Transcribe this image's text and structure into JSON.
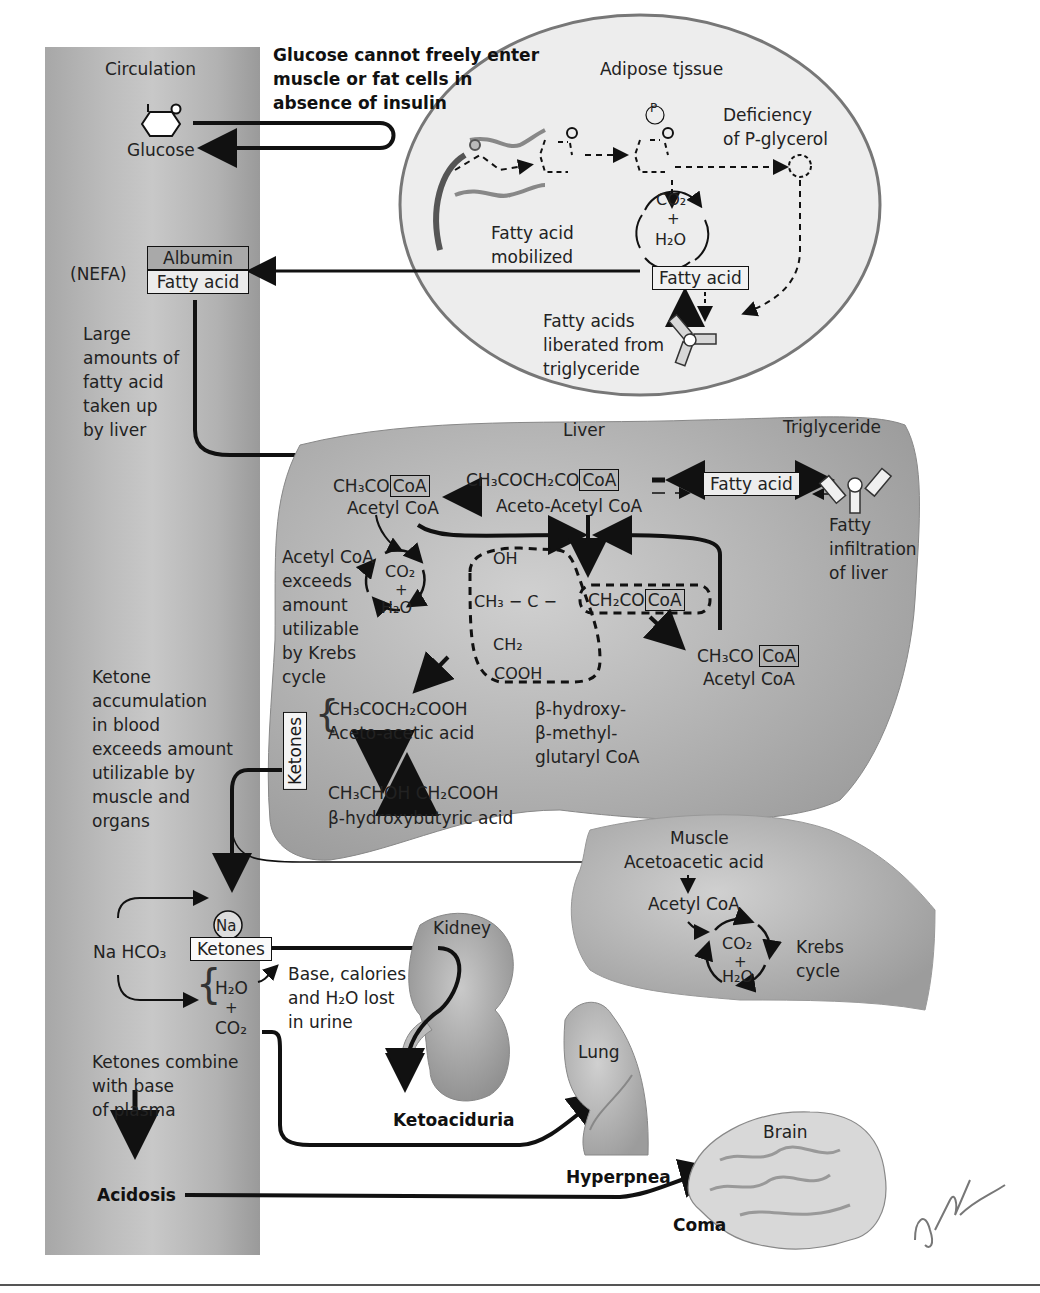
{
  "circulation": {
    "title": "Circulation",
    "glucose": "Glucose",
    "nefa": "(NEFA)",
    "albumin": "Albumin",
    "fatty_acid": "Fatty acid",
    "large_amounts": "Large\namounts of\nfatty acid\ntaken up\nby liver",
    "ketone_accumulation": "Ketone\naccumulation\nin blood\nexceeds amount\nutilizable by\nmuscle and\norgans",
    "na": "Na",
    "ketones": "Ketones",
    "nahco3": "Na HCO₃",
    "h2o": "H₂O",
    "plus": "+",
    "co2": "CO₂",
    "ketones_combine": "Ketones combine\nwith base\nof plasma",
    "acidosis": "Acidosis"
  },
  "header_note": "Glucose cannot freely enter\nmuscle or fat cells in\nabsence of insulin",
  "adipose": {
    "title": "Adipose tjssue",
    "phosphate": "P",
    "deficiency": "Deficiency\nof P-glycerol",
    "co2": "CO₂",
    "plus": "+",
    "h2o": "H₂O",
    "fatty_acid_mobilized": "Fatty acid\nmobilized",
    "fatty_acid": "Fatty acid",
    "liberated": "Fatty acids\nliberated from\ntriglyceride"
  },
  "liver": {
    "title": "Liver",
    "triglyceride": "Triglyceride",
    "acetyl_coa_formula": "CH₃CO",
    "coa": "CoA",
    "acetyl_coa": "Acetyl CoA",
    "acetoacetyl_formula": "CH₃COCH₂CO",
    "acetoacetyl_coa": "Aceto-Acetyl CoA",
    "fatty_acid": "Fatty acid",
    "fatty_infiltration": "Fatty\ninfiltration\nof liver",
    "acetyl_exceeds": "Acetyl CoA\nexceeds\namount\nutilizable\nby Krebs\ncycle",
    "co2": "CO₂",
    "plus": "+",
    "h2o": "H₂O",
    "hmg_oh": "OH",
    "hmg_ch3": "CH₃ − C −",
    "hmg_ch2": "CH₂",
    "hmg_cooh": "COOH",
    "hmg_ch2co": "CH₂CO",
    "hmg_name": "β-hydroxy-\nβ-methyl-\nglutaryl CoA",
    "acetyl2_formula": "CH₃CO",
    "acetyl2_name": "Acetyl CoA",
    "ketones_label": "Ketones",
    "acetoacetic_formula": "CH₃COCH₂COOH",
    "acetoacetic_name": "Aceto-acetic acid",
    "hydroxybutyric_formula": "CH₃CHOH CH₂COOH",
    "hydroxybutyric_name": "β-hydroxybutyric acid"
  },
  "muscle": {
    "title": "Muscle",
    "acetoacetic": "Acetoacetic acid",
    "acetyl_coa": "Acetyl CoA",
    "co2": "CO₂",
    "plus": "+",
    "h2o": "H₂O",
    "krebs": "Krebs\ncycle"
  },
  "kidney": {
    "title": "Kidney",
    "lost": "Base, calories\nand H₂O lost\nin urine",
    "outcome": "Ketoaciduria"
  },
  "lung": {
    "title": "Lung",
    "outcome": "Hyperpnea"
  },
  "brain": {
    "title": "Brain",
    "outcome": "Coma"
  },
  "signature": "F. Netter M.D."
}
